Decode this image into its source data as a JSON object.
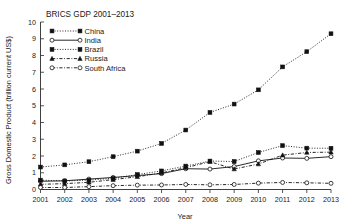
{
  "chart_data": {
    "type": "line",
    "title": "BRICS GDP 2001–2013",
    "xlabel": "Year",
    "ylabel": "Gross Domestic Product (trillion current US$)",
    "categories": [
      2001,
      2002,
      2003,
      2004,
      2005,
      2006,
      2007,
      2008,
      2009,
      2010,
      2011,
      2012,
      2013
    ],
    "xtick_labels": [
      "2001",
      "2002",
      "2003",
      "2004",
      "2005",
      "2006",
      "2007",
      "2008",
      "2009",
      "2010",
      "2011",
      "2012",
      "2013"
    ],
    "ytick_labels": [
      "0",
      "1",
      "2",
      "3",
      "4",
      "5",
      "6",
      "7",
      "8",
      "9",
      "10"
    ],
    "ylim": [
      0,
      10
    ],
    "xlim": [
      2001,
      2013
    ],
    "grid": false,
    "legend_position": "upper-left",
    "series": [
      {
        "name": "China",
        "marker": "filled-square",
        "line_style": "dotted",
        "color": "#111111",
        "values": [
          1.34,
          1.47,
          1.66,
          1.96,
          2.29,
          2.75,
          3.55,
          4.6,
          5.1,
          5.95,
          7.32,
          8.23,
          9.3
        ]
      },
      {
        "name": "India",
        "marker": "open-circle",
        "line_style": "solid",
        "color": "#111111",
        "values": [
          0.49,
          0.52,
          0.62,
          0.72,
          0.83,
          0.95,
          1.24,
          1.22,
          1.37,
          1.71,
          1.88,
          1.86,
          1.96
        ]
      },
      {
        "name": "Brazil",
        "marker": "filled-square",
        "line_style": "dotted",
        "color": "#111111",
        "values": [
          0.56,
          0.51,
          0.56,
          0.67,
          0.89,
          1.11,
          1.4,
          1.7,
          1.67,
          2.21,
          2.62,
          2.47,
          2.46
        ]
      },
      {
        "name": "Russia",
        "marker": "filled-triangle",
        "line_style": "dash-dot",
        "color": "#111111",
        "values": [
          0.31,
          0.35,
          0.43,
          0.59,
          0.76,
          0.99,
          1.3,
          1.66,
          1.22,
          1.52,
          2.05,
          2.21,
          2.23
        ]
      },
      {
        "name": "South Africa",
        "marker": "open-circle",
        "line_style": "dash-dot",
        "color": "#111111",
        "values": [
          0.12,
          0.12,
          0.17,
          0.23,
          0.26,
          0.27,
          0.3,
          0.28,
          0.3,
          0.38,
          0.42,
          0.4,
          0.37
        ]
      }
    ]
  },
  "legend": {
    "entries": [
      {
        "label": "China"
      },
      {
        "label": "India"
      },
      {
        "label": "Brazil"
      },
      {
        "label": "Russia"
      },
      {
        "label": "South Africa"
      }
    ]
  }
}
